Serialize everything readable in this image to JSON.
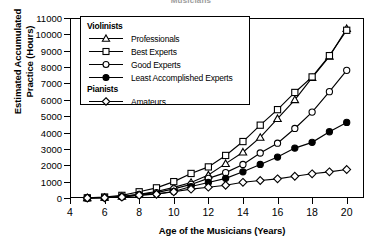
{
  "chart_data": {
    "type": "line",
    "title": "Musicians",
    "xlabel": "Age of the Musicians (Years)",
    "ylabel_line1": "Estimated Accumulated",
    "ylabel_line2": "Practice (Hours)",
    "xlim": [
      4,
      21
    ],
    "ylim": [
      0,
      11000
    ],
    "grid": false,
    "legend_position": "upper-left-inside",
    "xticks": [
      4,
      6,
      8,
      10,
      12,
      14,
      16,
      18,
      20
    ],
    "xtick_labels": [
      "4",
      "6",
      "8",
      "10",
      "12",
      "14",
      "16",
      "18",
      "20"
    ],
    "yticks": [
      0,
      1000,
      2000,
      3000,
      4000,
      5000,
      6000,
      7000,
      8000,
      9000,
      10000,
      11000
    ],
    "ytick_labels": [
      "0",
      "1000",
      "2000",
      "3000",
      "4000",
      "5000",
      "6000",
      "7000",
      "8000",
      "9000",
      "10000",
      "11000"
    ],
    "x": [
      5,
      6,
      7,
      8,
      9,
      10,
      11,
      12,
      13,
      14,
      15,
      16,
      17,
      18,
      19,
      20
    ],
    "series": [
      {
        "name": "Professionals",
        "group": "Violinists",
        "marker": "triangle-up",
        "fill": "open",
        "values": [
          0,
          30,
          90,
          230,
          400,
          650,
          950,
          1400,
          2100,
          2800,
          3700,
          4850,
          6000,
          7350,
          8650,
          10350
        ]
      },
      {
        "name": "Best Experts",
        "group": "Violinists",
        "marker": "square",
        "fill": "open",
        "values": [
          10,
          60,
          160,
          380,
          620,
          1000,
          1500,
          1900,
          2600,
          3450,
          4450,
          5400,
          6450,
          7400,
          8700,
          10250
        ]
      },
      {
        "name": "Good Experts",
        "group": "Violinists",
        "marker": "circle",
        "fill": "open",
        "values": [
          0,
          25,
          80,
          220,
          330,
          560,
          830,
          1200,
          1550,
          2050,
          2750,
          3350,
          4250,
          5250,
          6500,
          7800
        ]
      },
      {
        "name": "Least Accomplished Experts",
        "group": "Violinists",
        "marker": "circle",
        "fill": "filled",
        "values": [
          0,
          20,
          70,
          180,
          250,
          400,
          700,
          950,
          1200,
          1600,
          2050,
          2500,
          3050,
          3400,
          4050,
          4620
        ]
      },
      {
        "name": "Amateurs",
        "group": "Pianists",
        "marker": "diamond",
        "fill": "open",
        "values": [
          0,
          15,
          60,
          170,
          230,
          380,
          540,
          660,
          780,
          960,
          1070,
          1170,
          1330,
          1480,
          1600,
          1740
        ]
      }
    ]
  },
  "legend": {
    "groups": [
      {
        "heading": "Violinists",
        "entries": [
          {
            "label": "Professionals",
            "marker": "triangle-up",
            "fill": "open"
          },
          {
            "label": "Best Experts",
            "marker": "square",
            "fill": "open"
          },
          {
            "label": "Good Experts",
            "marker": "circle",
            "fill": "open"
          },
          {
            "label": "Least Accomplished Experts",
            "marker": "circle",
            "fill": "filled"
          }
        ]
      },
      {
        "heading": "Pianists",
        "entries": [
          {
            "label": "Amateurs",
            "marker": "diamond",
            "fill": "open"
          }
        ]
      }
    ]
  },
  "colors": {
    "line": "#000000",
    "marker_fill_open": "#ffffff",
    "marker_fill_solid": "#000000",
    "background": "#ffffff",
    "title": "#4a4a4a"
  }
}
